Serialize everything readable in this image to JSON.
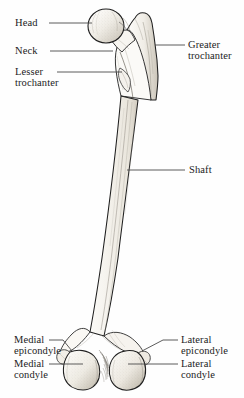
{
  "figure": {
    "view": "anterior",
    "background_color": "#fefefe",
    "ink_color": "#1c1c1c",
    "line_color": "#4a4a4a",
    "bone_fill": "#f2efe9",
    "shading_color": "#b9b3a8"
  },
  "labels": {
    "head": "Head",
    "neck": "Neck",
    "lesser_trochanter_line1": "Lesser",
    "lesser_trochanter_line2": "trochanter",
    "greater_trochanter_line1": "Greater",
    "greater_trochanter_line2": "trochanter",
    "shaft": "Shaft",
    "medial_epicondyle_line1": "Medial",
    "medial_epicondyle_line2": "epicondyle",
    "medial_condyle_line1": "Medial",
    "medial_condyle_line2": "condyle",
    "lateral_epicondyle_line1": "Lateral",
    "lateral_epicondyle_line2": "epicondyle",
    "lateral_condyle_line1": "Lateral",
    "lateral_condyle_line2": "condyle"
  }
}
